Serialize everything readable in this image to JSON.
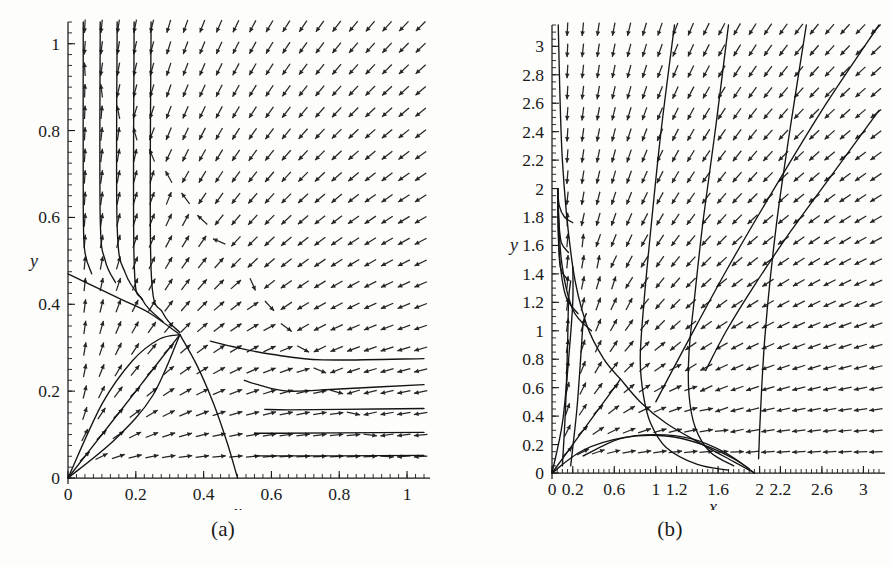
{
  "figure": {
    "title": "",
    "panels": [
      {
        "id": "a",
        "caption": "(a)",
        "xlabel": "x",
        "ylabel": "y",
        "xticks": [
          "0",
          "0.2",
          "0.4",
          "0.6",
          "0.8",
          "1"
        ],
        "xtick_values": [
          0,
          0.2,
          0.4,
          0.6,
          0.8,
          1
        ],
        "yticks": [
          "0",
          "0.2",
          "0.4",
          "0.6",
          "0.8",
          "1"
        ],
        "ytick_values": [
          0,
          0.2,
          0.4,
          0.6,
          0.8,
          1
        ],
        "xlim": [
          0,
          1.05
        ],
        "ylim": [
          0,
          1.05
        ]
      },
      {
        "id": "b",
        "caption": "(b)",
        "xlabel": "x",
        "ylabel": "y",
        "xticks": [
          "0",
          "0.2",
          "0.6",
          "1",
          "1.2",
          "1.6",
          "2",
          "2.2",
          "2.6",
          "3"
        ],
        "xtick_values": [
          0,
          0.2,
          0.6,
          1,
          1.2,
          1.6,
          2,
          2.2,
          2.6,
          3
        ],
        "yticks": [
          "0",
          "0.2",
          "0.4",
          "0.6",
          "0.8",
          "1",
          "1.2",
          "1.4",
          "1.6",
          "1.8",
          "2",
          "2.2",
          "2.4",
          "2.6",
          "2.8",
          "3"
        ],
        "ytick_values": [
          0,
          0.2,
          0.4,
          0.6,
          0.8,
          1,
          1.2,
          1.4,
          1.6,
          1.8,
          2,
          2.2,
          2.4,
          2.6,
          2.8,
          3
        ],
        "xlim": [
          0,
          3.15
        ],
        "ylim": [
          0,
          3.15
        ]
      }
    ]
  },
  "chart_data": [
    {
      "type": "scatter",
      "subtype": "direction-field-phase-portrait",
      "panel": "a",
      "title": "",
      "xlabel": "x",
      "ylabel": "y",
      "xlim": [
        0,
        1.05
      ],
      "ylim": [
        0,
        1.05
      ],
      "grid": false,
      "legend": "none",
      "xticks": [
        0,
        0.2,
        0.4,
        0.6,
        0.8,
        1
      ],
      "yticks": [
        0,
        0.2,
        0.4,
        0.6,
        0.8,
        1
      ],
      "xtick_labels": [
        "0",
        "0.2",
        "0.4",
        "0.6",
        "0.8",
        "1"
      ],
      "ytick_labels": [
        "0",
        "0.2",
        "0.4",
        "0.6",
        "0.8",
        "1"
      ],
      "field": {
        "nx": 21,
        "ny": 21,
        "model": "competition",
        "dx": "x*(1 - x - y)",
        "dy": "y*(1 - x - y)*0.9"
      },
      "equilibria": [
        {
          "x": 0,
          "y": 0,
          "kind": "unstable-node"
        },
        {
          "x": 0.33,
          "y": 0.33,
          "kind": "saddle"
        }
      ],
      "trajectories": [
        {
          "name": "separatrix-incoming-upper-left",
          "points": [
            [
              0.0,
              0.47
            ],
            [
              0.08,
              0.44
            ],
            [
              0.16,
              0.41
            ],
            [
              0.24,
              0.38
            ],
            [
              0.33,
              0.33
            ]
          ]
        },
        {
          "name": "separatrix-outgoing-lower",
          "points": [
            [
              0.33,
              0.33
            ],
            [
              0.38,
              0.26
            ],
            [
              0.43,
              0.17
            ],
            [
              0.47,
              0.08
            ],
            [
              0.5,
              0.0
            ]
          ]
        },
        {
          "name": "orbit-from-origin-arc",
          "points": [
            [
              0.0,
              0.0
            ],
            [
              0.1,
              0.17
            ],
            [
              0.19,
              0.27
            ],
            [
              0.27,
              0.32
            ],
            [
              0.33,
              0.33
            ]
          ]
        },
        {
          "name": "orbit-origin-ray-1",
          "points": [
            [
              0.0,
              0.0
            ],
            [
              0.11,
              0.11
            ],
            [
              0.22,
              0.22
            ],
            [
              0.33,
              0.33
            ]
          ]
        },
        {
          "name": "orbit-origin-ray-2",
          "points": [
            [
              0.0,
              0.0
            ],
            [
              0.14,
              0.09
            ],
            [
              0.25,
              0.19
            ],
            [
              0.33,
              0.33
            ]
          ]
        },
        {
          "name": "orbit-top-vertical-1",
          "points": [
            [
              0.045,
              1.05
            ],
            [
              0.045,
              0.62
            ],
            [
              0.05,
              0.52
            ],
            [
              0.07,
              0.47
            ]
          ]
        },
        {
          "name": "orbit-top-vertical-2",
          "points": [
            [
              0.095,
              1.05
            ],
            [
              0.095,
              0.6
            ],
            [
              0.11,
              0.5
            ],
            [
              0.14,
              0.45
            ]
          ]
        },
        {
          "name": "orbit-top-vertical-3",
          "points": [
            [
              0.145,
              1.05
            ],
            [
              0.145,
              0.58
            ],
            [
              0.17,
              0.47
            ],
            [
              0.22,
              0.41
            ]
          ]
        },
        {
          "name": "orbit-top-vertical-4",
          "points": [
            [
              0.195,
              1.05
            ],
            [
              0.195,
              0.5
            ],
            [
              0.22,
              0.41
            ],
            [
              0.28,
              0.36
            ]
          ]
        },
        {
          "name": "orbit-top-vertical-5",
          "points": [
            [
              0.245,
              1.05
            ],
            [
              0.245,
              0.48
            ],
            [
              0.28,
              0.38
            ],
            [
              0.33,
              0.335
            ]
          ]
        },
        {
          "name": "orbit-right-horizontal-1",
          "points": [
            [
              1.05,
              0.275
            ],
            [
              0.75,
              0.272
            ],
            [
              0.6,
              0.285
            ],
            [
              0.5,
              0.3
            ],
            [
              0.42,
              0.315
            ]
          ]
        },
        {
          "name": "orbit-right-horizontal-2",
          "points": [
            [
              1.05,
              0.215
            ],
            [
              0.8,
              0.205
            ],
            [
              0.65,
              0.2
            ],
            [
              0.56,
              0.215
            ],
            [
              0.52,
              0.225
            ]
          ]
        },
        {
          "name": "orbit-right-horizontal-3",
          "points": [
            [
              1.05,
              0.16
            ],
            [
              0.8,
              0.158
            ],
            [
              0.65,
              0.157
            ],
            [
              0.58,
              0.158
            ]
          ]
        },
        {
          "name": "orbit-right-horizontal-4",
          "points": [
            [
              1.05,
              0.105
            ],
            [
              0.8,
              0.104
            ],
            [
              0.62,
              0.103
            ],
            [
              0.55,
              0.103
            ]
          ]
        },
        {
          "name": "orbit-right-horizontal-5",
          "points": [
            [
              1.05,
              0.052
            ],
            [
              0.8,
              0.051
            ],
            [
              0.62,
              0.051
            ],
            [
              0.55,
              0.051
            ]
          ]
        }
      ]
    },
    {
      "type": "scatter",
      "subtype": "direction-field-phase-portrait",
      "panel": "b",
      "title": "",
      "xlabel": "x",
      "ylabel": "y",
      "xlim": [
        0,
        3.15
      ],
      "ylim": [
        0,
        3.15
      ],
      "grid": false,
      "legend": "none",
      "xticks": [
        0,
        0.2,
        0.6,
        1,
        1.2,
        1.6,
        2,
        2.2,
        2.6,
        3
      ],
      "yticks": [
        0,
        0.2,
        0.4,
        0.6,
        0.8,
        1,
        1.2,
        1.4,
        1.6,
        1.8,
        2,
        2.2,
        2.4,
        2.6,
        2.8,
        3
      ],
      "xtick_labels": [
        "0",
        "0.2",
        "0.6",
        "1",
        "1.2",
        "1.6",
        "2",
        "2.2",
        "2.6",
        "3"
      ],
      "ytick_labels": [
        "0",
        "0.2",
        "0.4",
        "0.6",
        "0.8",
        "1",
        "1.2",
        "1.4",
        "1.6",
        "1.8",
        "2",
        "2.2",
        "2.4",
        "2.6",
        "2.8",
        "3"
      ],
      "field": {
        "nx": 21,
        "ny": 21,
        "model": "competition",
        "dx": "x*(2 - x - y)",
        "dy": "y*(2 - x - y)*0.9"
      },
      "equilibria": [
        {
          "x": 0,
          "y": 0,
          "kind": "unstable-node"
        },
        {
          "x": 0.66,
          "y": 0.66,
          "kind": "saddle"
        },
        {
          "x": 2.0,
          "y": 0,
          "kind": "stable-node"
        },
        {
          "x": 0,
          "y": 2.0,
          "kind": "stable-node"
        }
      ],
      "trajectories": [
        {
          "name": "separatrix-upper-branch",
          "points": [
            [
              0.06,
              3.15
            ],
            [
              0.1,
              2.2
            ],
            [
              0.2,
              1.45
            ],
            [
              0.33,
              1.05
            ],
            [
              0.5,
              0.8
            ],
            [
              0.66,
              0.66
            ]
          ]
        },
        {
          "name": "separatrix-lower-branch",
          "points": [
            [
              0.66,
              0.66
            ],
            [
              0.85,
              0.5
            ],
            [
              1.1,
              0.35
            ],
            [
              1.45,
              0.2
            ],
            [
              1.75,
              0.08
            ],
            [
              1.95,
              0.0
            ]
          ]
        },
        {
          "name": "orbit-origin-ray-diag",
          "points": [
            [
              0.0,
              0.0
            ],
            [
              0.22,
              0.22
            ],
            [
              0.44,
              0.44
            ],
            [
              0.66,
              0.66
            ]
          ]
        },
        {
          "name": "orbit-origin-arc-lower",
          "points": [
            [
              0.0,
              0.0
            ],
            [
              0.3,
              0.16
            ],
            [
              0.7,
              0.25
            ],
            [
              1.1,
              0.26
            ],
            [
              1.45,
              0.2
            ],
            [
              1.75,
              0.1
            ],
            [
              1.95,
              0.0
            ]
          ]
        },
        {
          "name": "orbit-origin-arc-upper",
          "points": [
            [
              0.0,
              0.0
            ],
            [
              0.1,
              0.35
            ],
            [
              0.16,
              0.8
            ],
            [
              0.2,
              1.2
            ],
            [
              0.2,
              1.45
            ]
          ]
        },
        {
          "name": "orbit-left-down-1",
          "points": [
            [
              0.055,
              2.0
            ],
            [
              0.07,
              1.88
            ],
            [
              0.12,
              1.8
            ],
            [
              0.2,
              1.76
            ]
          ]
        },
        {
          "name": "orbit-left-down-2",
          "points": [
            [
              0.055,
              2.0
            ],
            [
              0.065,
              1.78
            ],
            [
              0.09,
              1.62
            ],
            [
              0.16,
              1.55
            ]
          ]
        },
        {
          "name": "orbit-left-down-3",
          "points": [
            [
              0.055,
              2.0
            ],
            [
              0.06,
              1.7
            ],
            [
              0.08,
              1.45
            ],
            [
              0.15,
              1.36
            ]
          ]
        },
        {
          "name": "orbit-left-down-4",
          "points": [
            [
              0.055,
              2.0
            ],
            [
              0.07,
              1.55
            ],
            [
              0.13,
              1.25
            ],
            [
              0.25,
              1.12
            ]
          ]
        },
        {
          "name": "orbit-left-down-5",
          "points": [
            [
              0.055,
              2.0
            ],
            [
              0.09,
              1.5
            ],
            [
              0.2,
              1.15
            ],
            [
              0.38,
              1.0
            ]
          ]
        },
        {
          "name": "orbit-inner-left-1",
          "points": [
            [
              0.1,
              0.05
            ],
            [
              0.13,
              0.45
            ],
            [
              0.15,
              0.9
            ],
            [
              0.16,
              1.22
            ],
            [
              0.18,
              1.35
            ]
          ]
        },
        {
          "name": "orbit-inner-left-2",
          "points": [
            [
              0.18,
              0.05
            ],
            [
              0.24,
              0.45
            ],
            [
              0.28,
              0.85
            ],
            [
              0.3,
              1.05
            ],
            [
              0.33,
              1.12
            ]
          ]
        },
        {
          "name": "orbit-right-converge-1",
          "points": [
            [
              1.18,
              3.15
            ],
            [
              1.05,
              2.4
            ],
            [
              0.95,
              1.7
            ],
            [
              0.88,
              1.15
            ],
            [
              0.85,
              0.8
            ],
            [
              0.88,
              0.55
            ],
            [
              0.95,
              0.35
            ],
            [
              1.1,
              0.18
            ],
            [
              1.4,
              0.06
            ],
            [
              1.7,
              0.02
            ]
          ]
        },
        {
          "name": "orbit-right-converge-2",
          "points": [
            [
              1.7,
              3.15
            ],
            [
              1.58,
              2.45
            ],
            [
              1.46,
              1.8
            ],
            [
              1.38,
              1.28
            ],
            [
              1.32,
              0.85
            ],
            [
              1.32,
              0.55
            ],
            [
              1.38,
              0.32
            ],
            [
              1.52,
              0.15
            ],
            [
              1.75,
              0.05
            ]
          ]
        },
        {
          "name": "orbit-right-converge-3",
          "points": [
            [
              2.45,
              3.15
            ],
            [
              2.3,
              2.45
            ],
            [
              2.18,
              1.85
            ],
            [
              2.1,
              1.35
            ],
            [
              2.05,
              0.95
            ],
            [
              2.02,
              0.6
            ],
            [
              2.0,
              0.3
            ],
            [
              1.99,
              0.1
            ]
          ]
        },
        {
          "name": "orbit-right-diag-1",
          "points": [
            [
              3.15,
              3.15
            ],
            [
              2.6,
              2.55
            ],
            [
              2.1,
              1.95
            ],
            [
              1.7,
              1.45
            ],
            [
              1.4,
              1.05
            ],
            [
              1.18,
              0.75
            ],
            [
              1.0,
              0.5
            ]
          ]
        },
        {
          "name": "orbit-right-diag-2",
          "points": [
            [
              3.15,
              2.55
            ],
            [
              2.7,
              2.1
            ],
            [
              2.3,
              1.7
            ],
            [
              1.95,
              1.32
            ],
            [
              1.68,
              1.0
            ],
            [
              1.48,
              0.72
            ]
          ]
        },
        {
          "name": "orbit-bottom-flat",
          "points": [
            [
              0.3,
              0.12
            ],
            [
              0.65,
              0.24
            ],
            [
              1.0,
              0.27
            ],
            [
              1.35,
              0.24
            ],
            [
              1.65,
              0.15
            ],
            [
              1.9,
              0.03
            ]
          ]
        }
      ]
    }
  ]
}
